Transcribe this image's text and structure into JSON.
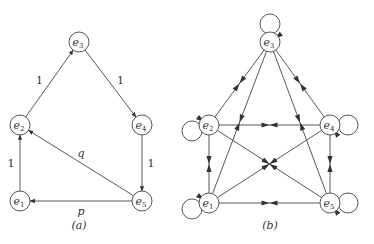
{
  "diagrams": [
    {
      "id": "a",
      "caption": "(a)",
      "nodes": [
        {
          "id": "e1",
          "base": "e",
          "sub": "1"
        },
        {
          "id": "e2",
          "base": "e",
          "sub": "2"
        },
        {
          "id": "e3",
          "base": "e",
          "sub": "3"
        },
        {
          "id": "e4",
          "base": "e",
          "sub": "4"
        },
        {
          "id": "e5",
          "base": "e",
          "sub": "5"
        }
      ],
      "edges": [
        {
          "from": "e1",
          "to": "e2",
          "label": "1"
        },
        {
          "from": "e2",
          "to": "e3",
          "label": "1"
        },
        {
          "from": "e3",
          "to": "e4",
          "label": "1"
        },
        {
          "from": "e4",
          "to": "e5",
          "label": "1"
        },
        {
          "from": "e5",
          "to": "e1",
          "label": "p"
        },
        {
          "from": "e5",
          "to": "e2",
          "label": "q"
        }
      ]
    },
    {
      "id": "b",
      "caption": "(b)",
      "nodes": [
        {
          "id": "e1",
          "base": "e",
          "sub": "1"
        },
        {
          "id": "e2",
          "base": "e",
          "sub": "2"
        },
        {
          "id": "e3",
          "base": "e",
          "sub": "3"
        },
        {
          "id": "e4",
          "base": "e",
          "sub": "4"
        },
        {
          "id": "e5",
          "base": "e",
          "sub": "5"
        }
      ],
      "self_loops": [
        "e1",
        "e2",
        "e3",
        "e4",
        "e5"
      ],
      "bidirectional_edges": [
        [
          "e1",
          "e2"
        ],
        [
          "e1",
          "e3"
        ],
        [
          "e1",
          "e4"
        ],
        [
          "e1",
          "e5"
        ],
        [
          "e2",
          "e3"
        ],
        [
          "e2",
          "e4"
        ],
        [
          "e2",
          "e5"
        ],
        [
          "e3",
          "e4"
        ],
        [
          "e3",
          "e5"
        ],
        [
          "e4",
          "e5"
        ]
      ]
    }
  ]
}
